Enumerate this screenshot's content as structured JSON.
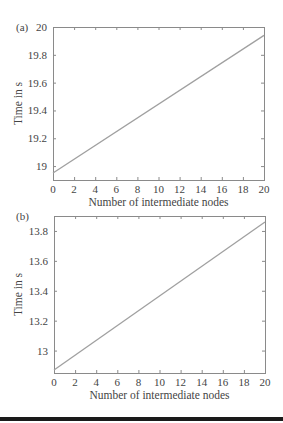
{
  "chart_data": [
    {
      "type": "line",
      "panel_label": "(a)",
      "title": "",
      "xlabel": "Number of intermediate nodes",
      "ylabel": "Time in s",
      "xlim": [
        0,
        20
      ],
      "ylim": [
        18.9,
        20.0
      ],
      "xticks": [
        0,
        2,
        4,
        6,
        8,
        10,
        12,
        14,
        16,
        18,
        20
      ],
      "xtick_labels": [
        "0",
        "2",
        "4",
        "6",
        "8",
        "10",
        "12",
        "14",
        "16",
        "18",
        "20"
      ],
      "yticks": [
        19.0,
        19.2,
        19.4,
        19.6,
        19.8,
        20.0
      ],
      "ytick_labels": [
        "19",
        "19.2",
        "19.4",
        "19.6",
        "19.8",
        "20"
      ],
      "grid": false,
      "series": [
        {
          "name": "time",
          "x": [
            0,
            20
          ],
          "y": [
            18.95,
            19.94
          ]
        }
      ]
    },
    {
      "type": "line",
      "panel_label": "(b)",
      "title": "",
      "xlabel": "Number of intermediate nodes",
      "ylabel": "Time in s",
      "xlim": [
        0,
        20
      ],
      "ylim": [
        12.85,
        13.9
      ],
      "xticks": [
        0,
        2,
        4,
        6,
        8,
        10,
        12,
        14,
        16,
        18,
        20
      ],
      "xtick_labels": [
        "0",
        "2",
        "4",
        "6",
        "8",
        "10",
        "12",
        "14",
        "16",
        "18",
        "20"
      ],
      "yticks": [
        13.0,
        13.2,
        13.4,
        13.6,
        13.8
      ],
      "ytick_labels": [
        "13",
        "13.2",
        "13.4",
        "13.6",
        "13.8"
      ],
      "grid": false,
      "series": [
        {
          "name": "time",
          "x": [
            0,
            20
          ],
          "y": [
            12.87,
            13.86
          ]
        }
      ]
    }
  ],
  "colors": {
    "line": "#a0a0a0",
    "axes": "#8a8a8a",
    "text": "#444444"
  }
}
